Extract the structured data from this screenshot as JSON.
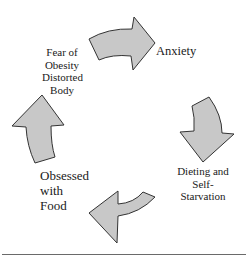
{
  "diagram": {
    "type": "cycle",
    "direction": "clockwise",
    "arrow_fill": "#c8c8c8",
    "arrow_stroke": "#333333",
    "nodes": [
      {
        "id": "fear",
        "lines": [
          "Fear of",
          "Obesity",
          "Distorted",
          "Body"
        ]
      },
      {
        "id": "anxiety",
        "lines": [
          "Anxiety"
        ]
      },
      {
        "id": "dieting",
        "lines": [
          "Dieting and",
          "Self-",
          "Starvation"
        ]
      },
      {
        "id": "obsessed",
        "lines": [
          "Obsessed",
          "with",
          "Food"
        ]
      }
    ],
    "edges": [
      {
        "from": "fear",
        "to": "anxiety",
        "icon": "curved-arrow-right"
      },
      {
        "from": "anxiety",
        "to": "dieting",
        "icon": "curved-arrow-down"
      },
      {
        "from": "dieting",
        "to": "obsessed",
        "icon": "curved-arrow-left"
      },
      {
        "from": "obsessed",
        "to": "fear",
        "icon": "curved-arrow-up"
      }
    ]
  }
}
